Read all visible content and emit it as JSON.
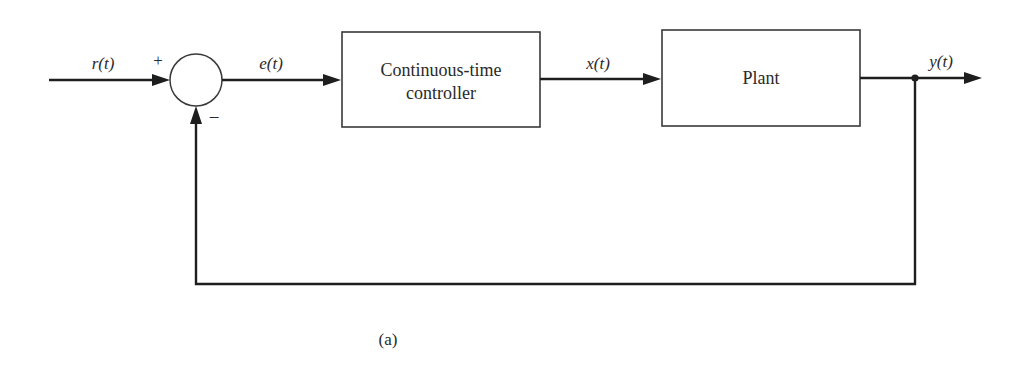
{
  "diagram": {
    "type": "feedback-control-block-diagram",
    "caption": "(a)",
    "signals": {
      "input": "r(t)",
      "error": "e(t)",
      "control": "x(t)",
      "output": "y(t)"
    },
    "summing_junction": {
      "plus_sign": "+",
      "minus_sign": "−"
    },
    "blocks": [
      {
        "id": "controller",
        "label_line1": "Continuous-time",
        "label_line2": "controller"
      },
      {
        "id": "plant",
        "label_line1": "Plant"
      }
    ],
    "colors": {
      "line": "#1e1e1e",
      "box_border": "#3a3a3a",
      "text": "#2a2a2a",
      "background": "#ffffff"
    }
  }
}
